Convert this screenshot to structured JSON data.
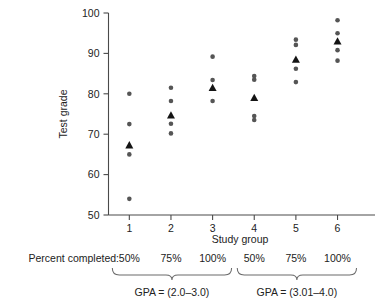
{
  "chart_data": {
    "type": "scatter",
    "title": "",
    "xlabel": "Study group",
    "ylabel": "Test grade",
    "xlim": [
      0.5,
      6.9
    ],
    "ylim": [
      50,
      100
    ],
    "ytick_values": [
      50,
      60,
      70,
      80,
      90,
      100
    ],
    "ytick_labels": [
      "50",
      "60",
      "70",
      "80",
      "90",
      "100"
    ],
    "xtick_values": [
      1,
      2,
      3,
      4,
      5,
      6
    ],
    "xtick_labels": [
      "1",
      "2",
      "3",
      "4",
      "5",
      "6"
    ],
    "grid": false,
    "legend": "none",
    "series": [
      {
        "name": "Individual test grades",
        "marker": "circle",
        "color": "#555555",
        "points": [
          {
            "x": 1,
            "y": 80.0
          },
          {
            "x": 1,
            "y": 72.5
          },
          {
            "x": 1,
            "y": 65.0
          },
          {
            "x": 1,
            "y": 54.0
          },
          {
            "x": 2,
            "y": 81.5
          },
          {
            "x": 2,
            "y": 78.2
          },
          {
            "x": 2,
            "y": 72.6
          },
          {
            "x": 2,
            "y": 70.2
          },
          {
            "x": 3,
            "y": 89.2
          },
          {
            "x": 3,
            "y": 83.4
          },
          {
            "x": 3,
            "y": 78.2
          },
          {
            "x": 4,
            "y": 84.4
          },
          {
            "x": 4,
            "y": 83.5
          },
          {
            "x": 4,
            "y": 74.5
          },
          {
            "x": 4,
            "y": 73.5
          },
          {
            "x": 5,
            "y": 93.4
          },
          {
            "x": 5,
            "y": 92.1
          },
          {
            "x": 5,
            "y": 86.2
          },
          {
            "x": 5,
            "y": 82.9
          },
          {
            "x": 6,
            "y": 98.2
          },
          {
            "x": 6,
            "y": 95.0
          },
          {
            "x": 6,
            "y": 90.8
          },
          {
            "x": 6,
            "y": 88.2
          }
        ]
      },
      {
        "name": "Group mean",
        "marker": "triangle",
        "color": "#141414",
        "points": [
          {
            "x": 1,
            "y": 67.3
          },
          {
            "x": 2,
            "y": 74.7
          },
          {
            "x": 3,
            "y": 81.5
          },
          {
            "x": 4,
            "y": 79.0
          },
          {
            "x": 5,
            "y": 88.5
          },
          {
            "x": 6,
            "y": 93.0
          }
        ]
      }
    ],
    "annotations": {
      "percent_completed_label": "Percent completed:",
      "percent_values": [
        "50%",
        "75%",
        "100%",
        "50%",
        "75%",
        "100%"
      ],
      "gpa_groups": [
        {
          "label": "GPA = (2.0–3.0)",
          "groups": [
            1,
            2,
            3
          ]
        },
        {
          "label": "GPA = (3.01–4.0)",
          "groups": [
            4,
            5,
            6
          ]
        }
      ]
    }
  }
}
